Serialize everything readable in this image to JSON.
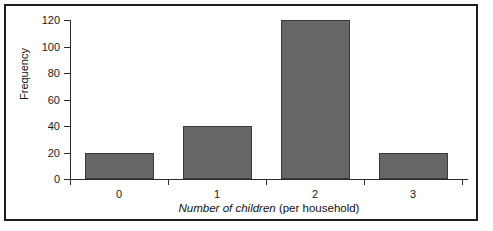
{
  "figure": {
    "background_color": "#ffffff",
    "frame_color": "#1e1e1e"
  },
  "chart_data": {
    "type": "bar",
    "title": "",
    "subtitle": "",
    "categories": [
      "0",
      "1",
      "2",
      "3"
    ],
    "values": [
      20,
      40,
      120,
      20
    ],
    "series": [
      {
        "name": "Frequency",
        "values": [
          20,
          40,
          120,
          20
        ]
      }
    ],
    "xlabel": "Number of children (per household)",
    "xlabel_italic_part": "Number of children",
    "xlabel_roman_part": " (per household)",
    "ylabel": "Frequency",
    "ylim": [
      0,
      120
    ],
    "ytick_values": [
      0,
      20,
      40,
      60,
      80,
      100,
      120
    ],
    "ytick_labels": [
      "0",
      "20",
      "40",
      "60",
      "80",
      "100",
      "120"
    ],
    "xtick_labels": [
      "0",
      "1",
      "2",
      "3"
    ],
    "grid": false,
    "legend": false,
    "legend_position": "none",
    "bar_color": "#666666",
    "bar_edge_color": "#3a3a3a",
    "axis_color": "#2a2a2a"
  }
}
